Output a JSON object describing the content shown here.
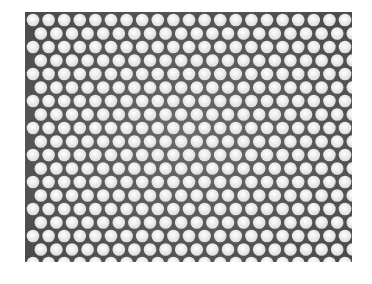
{
  "image": {
    "subject": "perforated metal sheet",
    "pattern": "hexagonal round-hole grid",
    "background_color": "#ffffff",
    "metal_color": "#5a5a5a",
    "hole_color": "#f2f2f2"
  },
  "sheet": {
    "left": 25,
    "top": 12,
    "width": 327,
    "height": 250
  },
  "grid": {
    "pitch_x": 15.6,
    "pitch_y": 13.5,
    "hole_radius": 6.3,
    "rows": 19,
    "cols": 21
  }
}
